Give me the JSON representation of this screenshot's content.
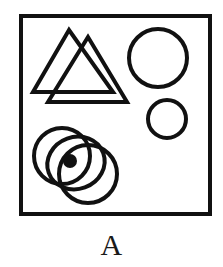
{
  "figure": {
    "panel_label": "A",
    "background_color": "#ffffff",
    "stroke_color": "#111111",
    "fill_color": "#111111",
    "frame": {
      "name": "panel-frame",
      "x": 19,
      "y": 14,
      "width": 193,
      "height": 202,
      "stroke_width": 4
    },
    "shapes": [
      {
        "id": "triangle-back",
        "type": "triangle",
        "label": "upper-left back triangle",
        "apex": [
          69,
          30
        ],
        "left": [
          33,
          92
        ],
        "right": [
          113,
          92
        ],
        "stroke_width": 4,
        "filled": false
      },
      {
        "id": "triangle-front",
        "type": "triangle",
        "label": "upper-left front triangle",
        "apex": [
          88,
          37
        ],
        "left": [
          48,
          102
        ],
        "right": [
          127,
          102
        ],
        "stroke_width": 4,
        "filled": false
      },
      {
        "id": "circle-large-right",
        "type": "circle",
        "label": "large right circle",
        "cx": 158,
        "cy": 58,
        "r": 29,
        "stroke_width": 4,
        "filled": false
      },
      {
        "id": "circle-small-right",
        "type": "circle",
        "label": "small right circle",
        "cx": 167,
        "cy": 119,
        "r": 19,
        "stroke_width": 4,
        "filled": false
      },
      {
        "id": "circle-cluster-upper-left",
        "type": "circle",
        "label": "bottom cluster upper-left circle",
        "cx": 62,
        "cy": 156,
        "r": 28,
        "stroke_width": 4,
        "filled": false
      },
      {
        "id": "circle-cluster-lower-right",
        "type": "circle",
        "label": "bottom cluster lower-right circle",
        "cx": 88,
        "cy": 174,
        "r": 29,
        "stroke_width": 4,
        "filled": false
      },
      {
        "id": "ellipse-cluster-middle",
        "type": "ellipse",
        "label": "bottom cluster middle ring holding the dot",
        "cx": 76,
        "cy": 163,
        "rx": 29,
        "ry": 26,
        "rotation": -20,
        "stroke_width": 4,
        "filled": false
      },
      {
        "id": "dot-center",
        "type": "circle",
        "label": "filled center dot",
        "cx": 70,
        "cy": 161,
        "r": 7,
        "stroke_width": 0,
        "filled": true
      }
    ]
  }
}
